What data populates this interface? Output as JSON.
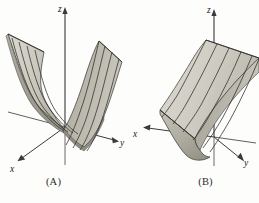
{
  "figure": {
    "background_color": "#fdfdfc",
    "axis_color": "#3a3a3a",
    "grid_curve_color": "#2e2e2a",
    "panels": [
      {
        "id": "A",
        "caption": "(A)",
        "axes": [
          {
            "name": "z-axis",
            "label": "z",
            "direction": "up"
          },
          {
            "name": "y-axis",
            "label": "y",
            "direction": "right"
          },
          {
            "name": "x-axis",
            "label": "x",
            "direction": "lower-left"
          }
        ],
        "surface": {
          "name": "parabolic-cylinder-trough",
          "description": "upward-opening parabolic cylinder (trough) extending along the x-direction",
          "light_face_color": "#d0cec4",
          "mid_face_color": "#bdbab0",
          "dark_face_color": "#a3a196",
          "edge_color": "#2e2e2a",
          "ruling_count": 6
        }
      },
      {
        "id": "B",
        "caption": "(B)",
        "axes": [
          {
            "name": "z-axis",
            "label": "z",
            "direction": "up"
          },
          {
            "name": "y-axis",
            "label": "y",
            "direction": "lower-right"
          },
          {
            "name": "x-axis",
            "label": "x",
            "direction": "left"
          }
        ],
        "surface": {
          "name": "parabolic-cylinder-trough-rotated",
          "description": "same parabolic cylinder viewed along the trough axis, sheets sweeping back to upper-right",
          "light_face_color": "#d3d1c7",
          "mid_face_color": "#c0bdb3",
          "dark_face_color": "#9e9c90",
          "edge_color": "#2e2e2a",
          "ruling_count": 6
        }
      }
    ]
  }
}
